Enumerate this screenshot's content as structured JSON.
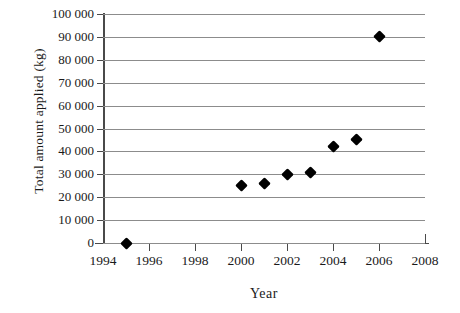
{
  "chart_data": {
    "type": "scatter",
    "title": "",
    "xlabel": "Year",
    "ylabel": "Total amount applied (kg)",
    "xlim": [
      1994,
      2008
    ],
    "ylim": [
      0,
      100000
    ],
    "grid": true,
    "legend": null,
    "x_tick_labels": [
      "1994",
      "1996",
      "1998",
      "2000",
      "2002",
      "2004",
      "2006",
      "2008"
    ],
    "x_tick_values": [
      1994,
      1996,
      1998,
      2000,
      2002,
      2004,
      2006,
      2008
    ],
    "x_minor_ticks": [
      1995,
      1997,
      1999,
      2001,
      2003,
      2005,
      2007
    ],
    "y_tick_labels": [
      "0",
      "10 000",
      "20 000",
      "30 000",
      "40 000",
      "50 000",
      "60 000",
      "70 000",
      "80 000",
      "90 000",
      "100 000"
    ],
    "y_tick_values": [
      0,
      10000,
      20000,
      30000,
      40000,
      50000,
      60000,
      70000,
      80000,
      90000,
      100000
    ],
    "x": [
      1995,
      2000,
      2001,
      2002,
      2003,
      2004,
      2005,
      2006
    ],
    "values": [
      0,
      25000,
      26000,
      30000,
      31000,
      42000,
      45000,
      90000
    ],
    "points": [
      {
        "x": 1995,
        "y": 0
      },
      {
        "x": 2000,
        "y": 25000
      },
      {
        "x": 2001,
        "y": 26000
      },
      {
        "x": 2002,
        "y": 30000
      },
      {
        "x": 2003,
        "y": 31000
      },
      {
        "x": 2004,
        "y": 42000
      },
      {
        "x": 2005,
        "y": 45000
      },
      {
        "x": 2006,
        "y": 90000
      }
    ],
    "marker": "diamond",
    "marker_color": "#000000",
    "gridline_color": "#8c8c8c",
    "axis_color": "#4a4a4a",
    "background_color": "#ffffff"
  }
}
